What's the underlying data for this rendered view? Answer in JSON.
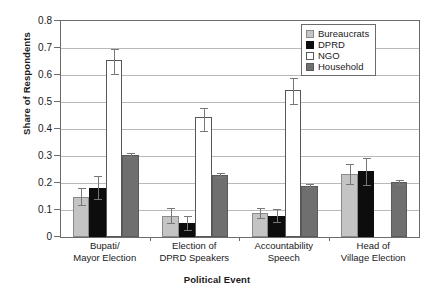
{
  "chart_data": {
    "type": "bar",
    "title": "",
    "xlabel": "Political Event",
    "ylabel": "Share of Respondents",
    "ylim": [
      0,
      0.8
    ],
    "ytick_labels": [
      "0",
      "0.1",
      "0.2",
      "0.3",
      "0.4",
      "0.5",
      "0.6",
      "0.7",
      "0.8"
    ],
    "ytick_values": [
      0,
      0.1,
      0.2,
      0.3,
      0.4,
      0.5,
      0.6,
      0.7,
      0.8
    ],
    "grid": "horizontal",
    "legend_position": "top-right-inside",
    "categories": [
      "Bupati/\nMayor Election",
      "Election of\nDPRD Speakers",
      "Accountability\nSpeech",
      "Head of\nVillage Election"
    ],
    "series": [
      {
        "name": "Bureaucrats",
        "color": "#c4c4c4",
        "values": [
          0.148,
          0.079,
          0.088,
          0.234
        ],
        "err_low": [
          0.118,
          0.051,
          0.07,
          0.196
        ],
        "err_high": [
          0.18,
          0.108,
          0.108,
          0.272
        ]
      },
      {
        "name": "DPRD",
        "color": "#0d0d0d",
        "values": [
          0.183,
          0.052,
          0.076,
          0.243
        ],
        "err_low": [
          0.14,
          0.026,
          0.056,
          0.194
        ],
        "err_high": [
          0.227,
          0.079,
          0.104,
          0.292
        ]
      },
      {
        "name": "NGO",
        "color": "#ffffff",
        "values": [
          0.655,
          0.443,
          0.543,
          null
        ],
        "err_low": [
          0.605,
          0.392,
          0.492,
          null
        ],
        "err_high": [
          0.698,
          0.478,
          0.588,
          null
        ]
      },
      {
        "name": "Household",
        "color": "#6f6f6f",
        "values": [
          0.305,
          0.23,
          0.19,
          0.205
        ],
        "err_low": [
          0.298,
          0.224,
          0.185,
          0.198
        ],
        "err_high": [
          0.312,
          0.236,
          0.196,
          0.212
        ]
      }
    ]
  },
  "legend": {
    "items": [
      {
        "label": "Bureaucrats",
        "key": "bureaucrats"
      },
      {
        "label": "DPRD",
        "key": "dprd"
      },
      {
        "label": "NGO",
        "key": "ngo"
      },
      {
        "label": "Household",
        "key": "household"
      }
    ]
  }
}
